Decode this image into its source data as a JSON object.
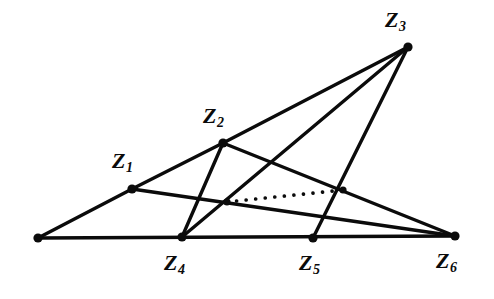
{
  "figure": {
    "kind": "geometric-point-configuration-diagram",
    "width": 494,
    "height": 299,
    "background_color": "#ffffff",
    "ink_color": "#0b0b0b"
  },
  "chart_data": {
    "type": "scatter",
    "title": "",
    "xlabel": "",
    "ylabel": "",
    "grid": false,
    "legend": null,
    "xlim": [
      0,
      494
    ],
    "ylim": [
      299,
      0
    ],
    "points": [
      {
        "id": "P0",
        "label": "",
        "x": 38,
        "y": 238,
        "label_x": 0,
        "label_y": 0,
        "labeled": false
      },
      {
        "id": "P1",
        "label": "Z1",
        "base": "Z",
        "sub": "1",
        "x": 132,
        "y": 189,
        "label_x": 112,
        "label_y": 150,
        "labeled": true
      },
      {
        "id": "P2",
        "label": "Z2",
        "base": "Z",
        "sub": "2",
        "x": 223,
        "y": 143,
        "label_x": 203,
        "label_y": 105,
        "labeled": true
      },
      {
        "id": "P3",
        "label": "Z3",
        "base": "Z",
        "sub": "3",
        "x": 408,
        "y": 47,
        "label_x": 385,
        "label_y": 9,
        "labeled": true
      },
      {
        "id": "P4",
        "label": "Z4",
        "base": "Z",
        "sub": "4",
        "x": 182,
        "y": 237,
        "label_x": 164,
        "label_y": 252,
        "labeled": true
      },
      {
        "id": "P5",
        "label": "Z5",
        "base": "Z",
        "sub": "5",
        "x": 313,
        "y": 238,
        "label_x": 299,
        "label_y": 252,
        "labeled": true
      },
      {
        "id": "P6",
        "label": "Z6",
        "base": "Z",
        "sub": "6",
        "x": 455,
        "y": 236,
        "label_x": 436,
        "label_y": 250,
        "labeled": true
      }
    ],
    "intersection_nodes": [
      {
        "id": "N_left",
        "x": 227,
        "y": 202
      },
      {
        "id": "N_right",
        "x": 343,
        "y": 190
      }
    ],
    "solid_edges": [
      {
        "from": "P0",
        "to": "P6",
        "name": "baseline"
      },
      {
        "from": "P0",
        "to": "P1",
        "name": "edge-P0-Z1"
      },
      {
        "from": "P1",
        "to": "P2",
        "name": "edge-Z1-Z2"
      },
      {
        "from": "P2",
        "to": "P3",
        "name": "edge-Z2-Z3"
      },
      {
        "from": "P3",
        "to": "P4",
        "name": "edge-Z3-Z4"
      },
      {
        "from": "P3",
        "to": "P5",
        "name": "edge-Z3-Z5"
      },
      {
        "from": "P2",
        "to": "P4",
        "name": "edge-Z2-Z4"
      },
      {
        "from": "P2",
        "to": "P6",
        "name": "edge-Z2-Z6"
      },
      {
        "from": "P1",
        "to": "P6",
        "name": "edge-Z1-Z6"
      }
    ],
    "dotted_edges": [
      {
        "from": "N_left",
        "to": "N_right",
        "name": "dotted-connector"
      }
    ]
  },
  "labels": {
    "z1": "Z",
    "z1_sub": "1",
    "z2": "Z",
    "z2_sub": "2",
    "z3": "Z",
    "z3_sub": "3",
    "z4": "Z",
    "z4_sub": "4",
    "z5": "Z",
    "z5_sub": "5",
    "z6": "Z",
    "z6_sub": "6"
  }
}
